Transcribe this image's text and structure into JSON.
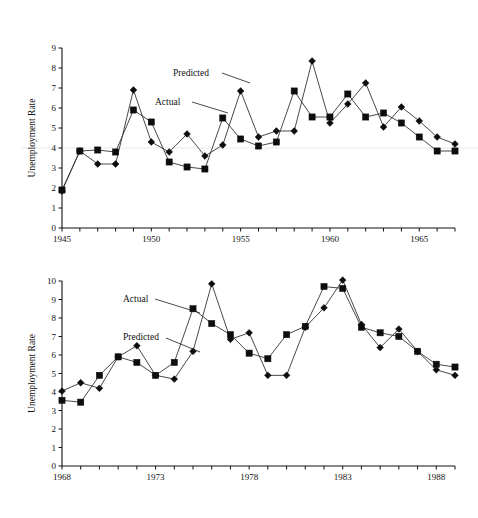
{
  "figure": {
    "background_color": "#ffffff",
    "ink_color": "#0d0d0d",
    "artifact_color": "#f2f0ee"
  },
  "charts": [
    {
      "id": "chart-top",
      "ylabel": "Unemployment Rate",
      "y_ticks": [
        "0",
        "1",
        "2",
        "3",
        "4",
        "5",
        "6",
        "7",
        "8",
        "9"
      ],
      "x_ticks_labeled": [
        "1945",
        "1950",
        "1955",
        "1960",
        "1965"
      ],
      "annotations": [
        {
          "label": "Predicted",
          "series": "Predicted"
        },
        {
          "label": "Actual",
          "series": "Actual"
        }
      ]
    },
    {
      "id": "chart-bottom",
      "ylabel": "Unemployment Rate",
      "y_ticks": [
        "0",
        "1",
        "2",
        "3",
        "4",
        "5",
        "6",
        "7",
        "8",
        "9",
        "10"
      ],
      "x_ticks_labeled": [
        "1968",
        "1973",
        "1978",
        "1983",
        "1988"
      ],
      "annotations": [
        {
          "label": "Actual",
          "series": "Actual"
        },
        {
          "label": "Predicted",
          "series": "Predicted"
        }
      ]
    }
  ],
  "chart_data": [
    {
      "type": "line",
      "id": "chart-top",
      "title": "",
      "xlabel": "",
      "ylabel": "Unemployment Rate",
      "xlim": [
        1945,
        1967
      ],
      "ylim": [
        0,
        9
      ],
      "grid": false,
      "legend_position": "inline-annotation",
      "x": [
        1945,
        1946,
        1947,
        1948,
        1949,
        1950,
        1951,
        1952,
        1953,
        1954,
        1955,
        1956,
        1957,
        1958,
        1959,
        1960,
        1961,
        1962,
        1963,
        1964,
        1965,
        1966,
        1967
      ],
      "series": [
        {
          "name": "Actual",
          "marker": "square",
          "values": [
            1.9,
            3.85,
            3.9,
            3.8,
            5.9,
            5.3,
            3.3,
            3.05,
            2.95,
            5.5,
            4.45,
            4.1,
            4.3,
            6.85,
            5.55,
            5.55,
            6.7,
            5.55,
            5.75,
            5.25,
            4.55,
            3.85,
            3.85
          ]
        },
        {
          "name": "Predicted",
          "marker": "diamond",
          "values": [
            1.85,
            3.85,
            3.2,
            3.2,
            6.9,
            4.3,
            3.8,
            4.7,
            3.6,
            4.15,
            6.85,
            4.55,
            4.85,
            4.85,
            8.35,
            5.25,
            6.2,
            7.25,
            5.05,
            6.05,
            5.35,
            4.55,
            4.2
          ]
        }
      ]
    },
    {
      "type": "line",
      "id": "chart-bottom",
      "title": "",
      "xlabel": "",
      "ylabel": "Unemployment Rate",
      "xlim": [
        1968,
        1989
      ],
      "ylim": [
        0,
        10
      ],
      "grid": false,
      "legend_position": "inline-annotation",
      "x": [
        1968,
        1969,
        1970,
        1971,
        1972,
        1973,
        1974,
        1975,
        1976,
        1977,
        1978,
        1979,
        1980,
        1981,
        1982,
        1983,
        1984,
        1985,
        1986,
        1987,
        1988,
        1989
      ],
      "series": [
        {
          "name": "Actual",
          "marker": "square",
          "values": [
            3.55,
            3.45,
            4.9,
            5.9,
            5.6,
            4.9,
            5.6,
            8.5,
            7.7,
            7.1,
            6.1,
            5.8,
            7.1,
            7.55,
            9.7,
            9.6,
            7.5,
            7.2,
            7.0,
            6.2,
            5.5,
            5.35
          ]
        },
        {
          "name": "Predicted",
          "marker": "diamond",
          "values": [
            4.05,
            4.5,
            4.2,
            5.9,
            6.5,
            4.9,
            4.7,
            6.2,
            9.85,
            6.85,
            7.2,
            4.9,
            4.9,
            7.5,
            8.55,
            10.05,
            7.65,
            6.4,
            7.4,
            6.2,
            5.2,
            4.9
          ]
        }
      ]
    }
  ]
}
